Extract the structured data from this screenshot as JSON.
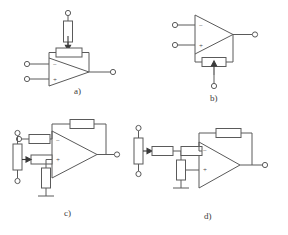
{
  "figure": {
    "background_color": "#ffffff",
    "line_color": "#5a5a5a",
    "panel_count": 4
  },
  "panels": [
    {
      "id": "a",
      "caption": "a)",
      "caption_x": 74,
      "caption_y": 94,
      "description": "Op-amp with adjustable feedback resistor on top; series resistor to terminal above",
      "opamp": {
        "label": "opamp-a",
        "inverting_sign": "−",
        "noninverting_sign": "+"
      },
      "components": [
        {
          "name": "feedback-potentiometer",
          "orientation": "horizontal",
          "has_wiper": true
        },
        {
          "name": "series-resistor",
          "orientation": "vertical",
          "has_wiper": false
        }
      ],
      "terminals": [
        "inverting-input-terminal",
        "noninverting-input-terminal",
        "output-terminal",
        "top-terminal"
      ]
    },
    {
      "id": "b",
      "caption": "b)",
      "caption_x": 214,
      "caption_y": 98,
      "description": "Op-amp with adjustable feedback resistor below; wiper tapped down to terminal",
      "opamp": {
        "label": "opamp-b",
        "inverting_sign": "−",
        "noninverting_sign": "+"
      },
      "components": [
        {
          "name": "feedback-potentiometer",
          "orientation": "horizontal",
          "has_wiper": true
        }
      ],
      "terminals": [
        "inverting-input-terminal",
        "noninverting-input-terminal",
        "output-terminal",
        "bottom-terminal"
      ]
    },
    {
      "id": "c",
      "caption": "c)",
      "caption_x": 68,
      "caption_y": 215,
      "description": "Non-inverting amp: input resistor to minus, feedback resistor over top, potentiometer feeding plus input via resistor, shunt resistor to ground",
      "opamp": {
        "label": "opamp-c",
        "inverting_sign": "−",
        "noninverting_sign": "+"
      },
      "components": [
        {
          "name": "input-resistor",
          "orientation": "horizontal",
          "has_wiper": false
        },
        {
          "name": "feedback-resistor",
          "orientation": "horizontal",
          "has_wiper": false
        },
        {
          "name": "bias-potentiometer",
          "orientation": "vertical",
          "has_wiper": true
        },
        {
          "name": "wiper-series-resistor",
          "orientation": "horizontal",
          "has_wiper": false
        },
        {
          "name": "shunt-resistor",
          "orientation": "vertical",
          "has_wiper": false
        }
      ],
      "terminals": [
        "input-terminal",
        "pot-top-terminal",
        "pot-bottom-terminal",
        "output-terminal"
      ],
      "ground_symbol": true
    },
    {
      "id": "d",
      "caption": "d)",
      "caption_x": 208,
      "caption_y": 218,
      "description": "Inverting amp: potentiometer into series resistor, node with shunt resistor to ground, second series resistor to minus input, feedback resistor over top, plus input to terminal",
      "opamp": {
        "label": "opamp-d",
        "inverting_sign": "−",
        "noninverting_sign": "+"
      },
      "components": [
        {
          "name": "bias-potentiometer",
          "orientation": "vertical",
          "has_wiper": true
        },
        {
          "name": "wiper-series-resistor",
          "orientation": "horizontal",
          "has_wiper": false
        },
        {
          "name": "shunt-resistor",
          "orientation": "vertical",
          "has_wiper": false
        },
        {
          "name": "input-resistor",
          "orientation": "horizontal",
          "has_wiper": false
        },
        {
          "name": "feedback-resistor",
          "orientation": "horizontal",
          "has_wiper": false
        }
      ],
      "terminals": [
        "pot-top-terminal",
        "pot-bottom-terminal",
        "noninverting-input-terminal",
        "output-terminal"
      ],
      "ground_symbol": true
    }
  ],
  "symbols": {
    "minus": "−",
    "plus": "+"
  }
}
